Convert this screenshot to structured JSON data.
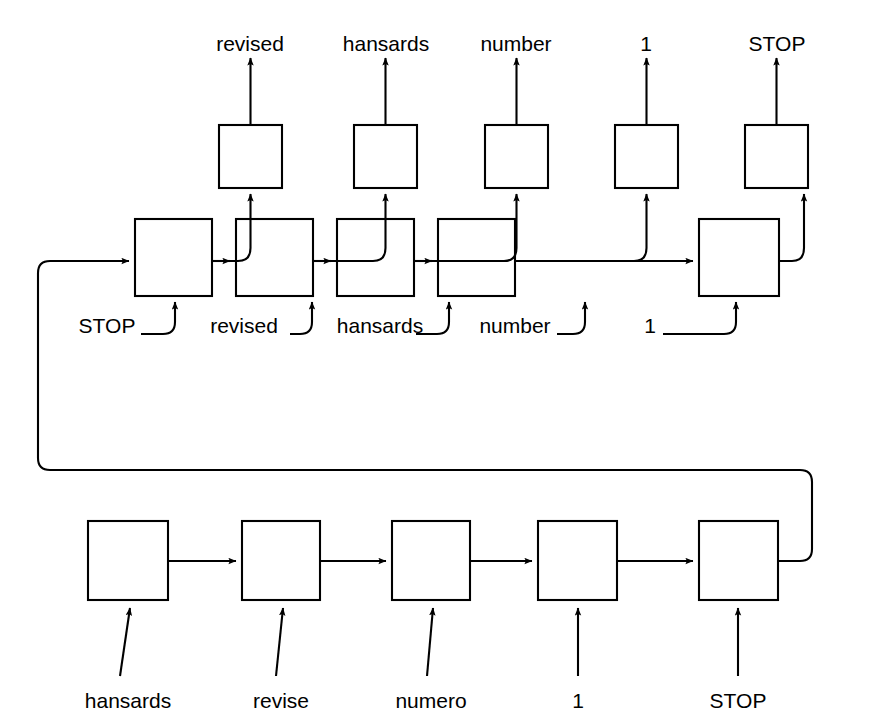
{
  "diagram": {
    "type": "sequence-to-sequence",
    "stroke_color": "#000000",
    "background_color": "#ffffff",
    "box_fill": "#ffffff"
  },
  "output_layer": {
    "name": "decoder-output-row",
    "labels": [
      "revised",
      "hansards",
      "number",
      "1",
      "STOP"
    ],
    "boxes": [
      {
        "x": 219,
        "y": 125,
        "w": 63,
        "h": 63
      },
      {
        "x": 354,
        "y": 125,
        "w": 63,
        "h": 63
      },
      {
        "x": 485,
        "y": 125,
        "w": 63,
        "h": 63
      },
      {
        "x": 615,
        "y": 125,
        "w": 63,
        "h": 63
      },
      {
        "x": 745,
        "y": 125,
        "w": 63,
        "h": 63
      }
    ],
    "label_y": 33,
    "label_x": [
      250,
      386,
      516,
      646,
      777
    ]
  },
  "decoder_layer": {
    "name": "decoder-state-row",
    "input_labels": [
      "STOP",
      "revised",
      "hansards",
      "number",
      "1"
    ],
    "boxes": [
      {
        "x": 135,
        "y": 219,
        "w": 77,
        "h": 77
      },
      {
        "x": 236,
        "y": 219,
        "w": 77,
        "h": 77
      },
      {
        "x": 337,
        "y": 219,
        "w": 77,
        "h": 77
      },
      {
        "x": 438,
        "y": 219,
        "w": 77,
        "h": 77
      },
      {
        "x": 699,
        "y": 219,
        "w": 80,
        "h": 77
      }
    ],
    "label_y": 325,
    "label_x": [
      107,
      244,
      380,
      515,
      650
    ]
  },
  "encoder_layer": {
    "name": "encoder-row",
    "input_labels": [
      "hansards",
      "revise",
      "numero",
      "1",
      "STOP"
    ],
    "boxes": [
      {
        "x": 88,
        "y": 521,
        "w": 80,
        "h": 79
      },
      {
        "x": 242,
        "y": 521,
        "w": 78,
        "h": 79
      },
      {
        "x": 392,
        "y": 521,
        "w": 78,
        "h": 79
      },
      {
        "x": 538,
        "y": 521,
        "w": 79,
        "h": 79
      },
      {
        "x": 699,
        "y": 521,
        "w": 79,
        "h": 79
      }
    ],
    "label_y": 700,
    "label_x": [
      128,
      281,
      431,
      578,
      738
    ]
  },
  "feedback": {
    "name": "encoder-to-decoder-state-loop",
    "description": "final encoder state routed around the left side into the first decoder cell"
  }
}
